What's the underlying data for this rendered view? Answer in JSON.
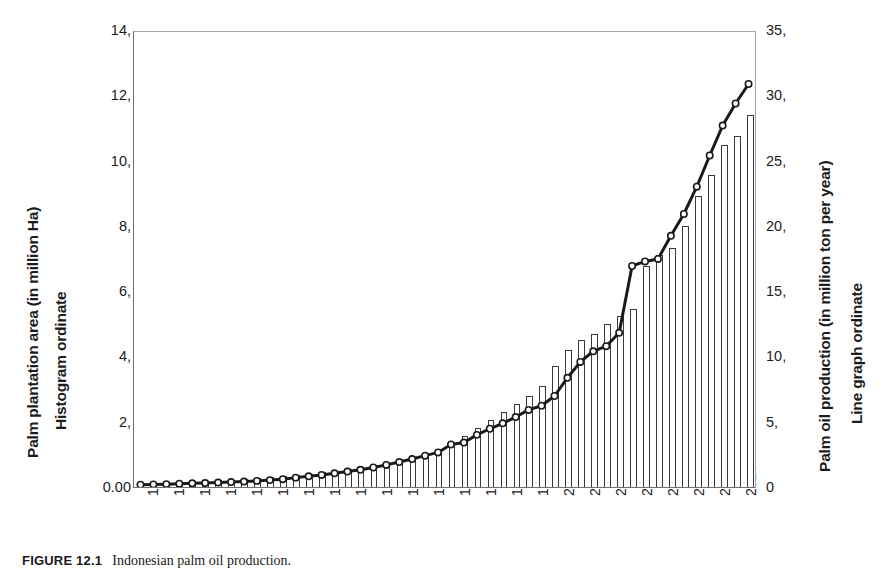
{
  "figure": {
    "caption_label": "FIGURE 12.1",
    "caption_text": "Indonesian palm oil production."
  },
  "axes": {
    "left_title_line1": "Palm plantation area (in million Ha)",
    "left_title_line2": "Histogram ordinate",
    "right_title_line1": "Palm oil production (in million ton per year)",
    "right_title_line2": "Line graph ordinate",
    "left_ticks": [
      "14,",
      "12,",
      "10,",
      "8,",
      "6,",
      "4,",
      "2,",
      "0.00"
    ],
    "right_ticks": [
      "35,",
      "30,",
      "25,",
      "20,",
      "15,",
      "10,",
      "5,",
      "0"
    ],
    "x_ticks": [
      "1968",
      "1970",
      "1972",
      "1974",
      "1976",
      "1978",
      "1980",
      "1982",
      "1984",
      "1986",
      "1988",
      "1990",
      "1992",
      "1994",
      "1996",
      "1998",
      "2000",
      "2002",
      "2004",
      "2006",
      "2008",
      "2010",
      "2012",
      "2014"
    ]
  },
  "chart_data": {
    "type": "bar",
    "title": "",
    "xlabel": "",
    "ylabel": "Palm plantation area (in million Ha)",
    "y2label": "Palm oil production (in million ton per year)",
    "ylim": [
      0,
      14
    ],
    "y2lim": [
      0,
      35
    ],
    "grid": false,
    "legend": "none",
    "categories": [
      "1968",
      "1969",
      "1970",
      "1971",
      "1972",
      "1973",
      "1974",
      "1975",
      "1976",
      "1977",
      "1978",
      "1979",
      "1980",
      "1981",
      "1982",
      "1983",
      "1984",
      "1985",
      "1986",
      "1987",
      "1988",
      "1989",
      "1990",
      "1991",
      "1992",
      "1993",
      "1994",
      "1995",
      "1996",
      "1997",
      "1998",
      "1999",
      "2000",
      "2001",
      "2002",
      "2003",
      "2004",
      "2005",
      "2006",
      "2007",
      "2008",
      "2009",
      "2010",
      "2011",
      "2012",
      "2013",
      "2014",
      "2015"
    ],
    "series": [
      {
        "name": "Palm plantation area (in million Ha)",
        "axis": "left",
        "render": "bar",
        "units": "million Ha",
        "values": [
          0.12,
          0.13,
          0.14,
          0.15,
          0.17,
          0.19,
          0.21,
          0.23,
          0.26,
          0.28,
          0.3,
          0.33,
          0.37,
          0.41,
          0.45,
          0.5,
          0.55,
          0.6,
          0.66,
          0.73,
          0.81,
          0.9,
          1.0,
          1.15,
          1.35,
          1.55,
          1.8,
          2.05,
          2.3,
          2.55,
          2.8,
          3.1,
          3.7,
          4.2,
          4.5,
          4.7,
          5.0,
          5.25,
          5.45,
          6.77,
          7.1,
          7.32,
          8.0,
          8.9,
          9.57,
          10.47,
          10.75,
          11.4
        ]
      },
      {
        "name": "Palm oil production (in million ton per year)",
        "axis": "right",
        "render": "line",
        "units": "million ton per year",
        "marker": "circle",
        "values": [
          0.18,
          0.2,
          0.22,
          0.25,
          0.28,
          0.3,
          0.34,
          0.38,
          0.42,
          0.47,
          0.53,
          0.6,
          0.72,
          0.82,
          0.93,
          1.05,
          1.19,
          1.32,
          1.5,
          1.7,
          1.92,
          2.15,
          2.41,
          2.66,
          3.27,
          3.42,
          4.01,
          4.48,
          4.9,
          5.38,
          5.93,
          6.25,
          7.0,
          8.4,
          9.62,
          10.44,
          10.83,
          11.86,
          17.0,
          17.35,
          17.54,
          19.32,
          21.0,
          23.1,
          25.5,
          27.8,
          29.5,
          31.0
        ]
      }
    ]
  }
}
